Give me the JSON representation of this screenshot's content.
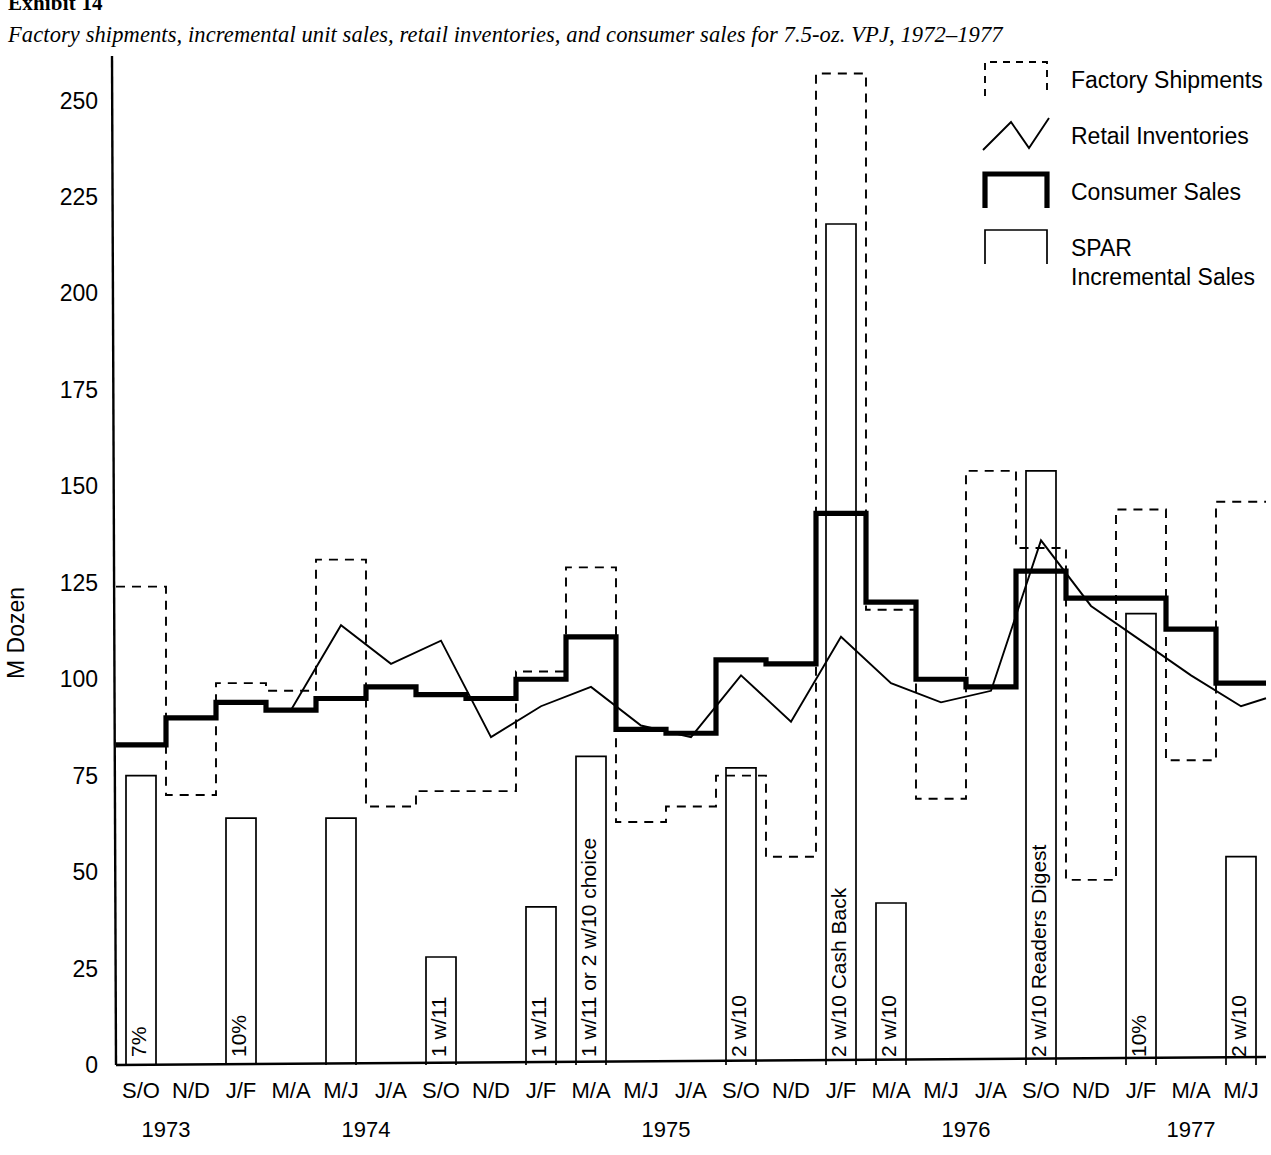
{
  "exhibit": {
    "label": "Exhibit 14"
  },
  "chart_data": {
    "type": "line",
    "title": "Factory shipments, incremental unit sales, retail inventories, and consumer sales for 7.5-oz. VPJ, 1972–1977",
    "xlabel": "",
    "ylabel": "M Dozen",
    "ylim": [
      0,
      260
    ],
    "yticks": [
      0,
      25,
      50,
      75,
      100,
      125,
      150,
      175,
      200,
      225,
      250
    ],
    "grid": false,
    "legend_position": "top-right",
    "categories": [
      "S/O",
      "N/D",
      "J/F",
      "M/A",
      "M/J",
      "J/A",
      "S/O",
      "N/D",
      "J/F",
      "M/A",
      "M/J",
      "J/A",
      "S/O",
      "N/D",
      "J/F",
      "M/A",
      "M/J",
      "J/A",
      "S/O",
      "N/D",
      "J/F",
      "M/A",
      "M/J"
    ],
    "year_groups": [
      {
        "year": "1973",
        "start_index": 0,
        "end_index": 1
      },
      {
        "year": "1974",
        "start_index": 2,
        "end_index": 7
      },
      {
        "year": "1975",
        "start_index": 8,
        "end_index": 13
      },
      {
        "year": "1976",
        "start_index": 14,
        "end_index": 19
      },
      {
        "year": "1977",
        "start_index": 20,
        "end_index": 22
      }
    ],
    "series": [
      {
        "name": "Factory Shipments",
        "style": "step-dashed",
        "values": [
          124,
          70,
          99,
          97,
          131,
          67,
          71,
          71,
          102,
          129,
          63,
          67,
          75,
          54,
          257,
          118,
          69,
          154,
          134,
          48,
          144,
          79,
          146
        ]
      },
      {
        "name": "Consumer Sales",
        "style": "step-thick",
        "values": [
          83,
          90,
          94,
          92,
          95,
          98,
          96,
          95,
          100,
          111,
          87,
          86,
          105,
          104,
          143,
          120,
          100,
          98,
          128,
          121,
          121,
          113,
          99
        ]
      },
      {
        "name": "Retail Inventories",
        "style": "line",
        "values": [
          null,
          null,
          null,
          92,
          114,
          104,
          110,
          85,
          93,
          98,
          88,
          85,
          101,
          89,
          111,
          99,
          94,
          97,
          136,
          119,
          110,
          101,
          93
        ]
      },
      {
        "name": "SPAR Incremental Sales",
        "style": "bar",
        "values": [
          75,
          null,
          64,
          null,
          64,
          null,
          28,
          null,
          41,
          80,
          null,
          null,
          77,
          null,
          218,
          42,
          null,
          null,
          154,
          null,
          117,
          null,
          54
        ]
      }
    ],
    "bar_annotations": [
      {
        "index": 0,
        "text": "7%"
      },
      {
        "index": 2,
        "text": "10%"
      },
      {
        "index": 6,
        "text": "1 w/11"
      },
      {
        "index": 8,
        "text": "1 w/11"
      },
      {
        "index": 9,
        "text": "1 w/11 or 2 w/10 choice"
      },
      {
        "index": 12,
        "text": "2 w/10"
      },
      {
        "index": 14,
        "text": "2 w/10 Cash Back"
      },
      {
        "index": 15,
        "text": "2 w/10"
      },
      {
        "index": 18,
        "text": "2 w/10 Readers Digest"
      },
      {
        "index": 20,
        "text": "10%"
      },
      {
        "index": 22,
        "text": "2 w/10"
      }
    ],
    "legend": [
      {
        "label": "Factory Shipments",
        "marker": "dashed-box"
      },
      {
        "label": "Retail Inventories",
        "marker": "zigzag-line"
      },
      {
        "label": "Consumer Sales",
        "marker": "thick-box"
      },
      {
        "label": "SPAR\nIncremental Sales",
        "marker": "thin-box"
      }
    ]
  },
  "colors": {
    "ink": "#000000",
    "paper": "#ffffff"
  }
}
